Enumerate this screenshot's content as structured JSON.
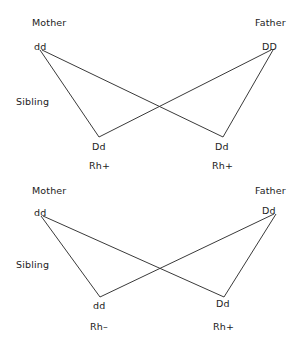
{
  "diagram": {
    "line_color": "#3a3a3a",
    "background_color": "#ffffff",
    "pedigrees": [
      {
        "id": "top",
        "mother": {
          "role": "Mother",
          "genotype": "dd"
        },
        "father": {
          "role": "Father",
          "genotype": "DD"
        },
        "sibling_label": "Sibling",
        "children": [
          {
            "genotype": "Dd",
            "phenotype": "Rh+"
          },
          {
            "genotype": "Dd",
            "phenotype": "Rh+"
          }
        ]
      },
      {
        "id": "bottom",
        "mother": {
          "role": "Mother",
          "genotype": "dd"
        },
        "father": {
          "role": "Father",
          "genotype": "Dd"
        },
        "sibling_label": "Sibling",
        "children": [
          {
            "genotype": "dd",
            "phenotype": "Rh–"
          },
          {
            "genotype": "Dd",
            "phenotype": "Rh+"
          }
        ]
      }
    ]
  }
}
